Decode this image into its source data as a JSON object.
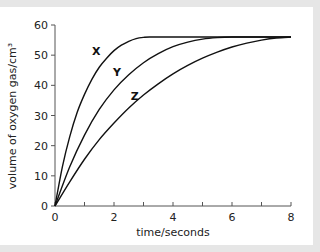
{
  "chart_data": {
    "type": "line",
    "title": "",
    "xlabel": "time/seconds",
    "ylabel": "volume of oxygen gas/cm³",
    "xlim": [
      0,
      8
    ],
    "ylim": [
      0,
      60
    ],
    "x_ticks": [
      0,
      2,
      4,
      6,
      8
    ],
    "x_minor_ticks": [
      1,
      3,
      5,
      7
    ],
    "y_ticks": [
      0,
      10,
      20,
      30,
      40,
      50,
      60
    ],
    "grid": false,
    "legend": "inline labels",
    "series": [
      {
        "name": "X",
        "label_pos": [
          1.4,
          50
        ],
        "x": [
          0,
          0.25,
          0.5,
          0.75,
          1,
          1.25,
          1.5,
          1.75,
          2,
          2.25,
          2.5,
          2.75,
          3,
          3.2,
          4,
          5,
          6,
          7,
          8
        ],
        "values": [
          0,
          13,
          23,
          31,
          37,
          42,
          46,
          49,
          51.5,
          53.3,
          54.6,
          55.5,
          55.9,
          56,
          56,
          56,
          56,
          56,
          56
        ]
      },
      {
        "name": "Y",
        "label_pos": [
          2.1,
          43
        ],
        "x": [
          0,
          0.5,
          1,
          1.5,
          2,
          2.5,
          3,
          3.5,
          4,
          4.5,
          5,
          5.5,
          6,
          7,
          8
        ],
        "values": [
          0,
          13,
          23.5,
          32,
          38.5,
          43.5,
          47.5,
          50.5,
          52.8,
          54.3,
          55.3,
          55.8,
          56,
          56,
          56
        ]
      },
      {
        "name": "Z",
        "label_pos": [
          2.7,
          35
        ],
        "x": [
          0,
          0.5,
          1,
          1.5,
          2,
          2.5,
          3,
          3.5,
          4,
          4.5,
          5,
          5.5,
          6,
          6.5,
          7,
          7.5,
          8
        ],
        "values": [
          0,
          8,
          15.5,
          22,
          27.5,
          32.5,
          36.8,
          40.5,
          43.8,
          46.6,
          49,
          51,
          52.7,
          54,
          55,
          55.7,
          56
        ]
      }
    ]
  }
}
